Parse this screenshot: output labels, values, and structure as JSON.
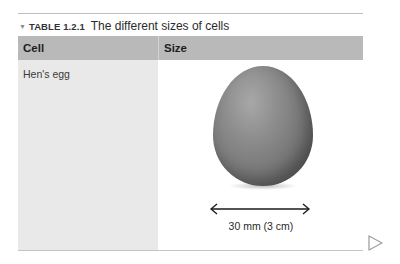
{
  "caption": {
    "toggle_icon": "▼",
    "label": "TABLE 1.2.1",
    "title": "The different sizes of cells"
  },
  "table": {
    "headers": [
      "Cell",
      "Size"
    ],
    "rows": [
      {
        "cell": "Hen's egg",
        "size": {
          "image": "egg-image",
          "measure_label": "30 mm (3 cm)"
        }
      }
    ]
  },
  "navigation": {
    "next_icon": "play-triangle-icon"
  },
  "colors": {
    "header_bg": "#b9b9b9",
    "left_column_bg": "#e9e9e9",
    "rule": "#bdbdbd",
    "nav_icon": "#a0a0a0"
  }
}
